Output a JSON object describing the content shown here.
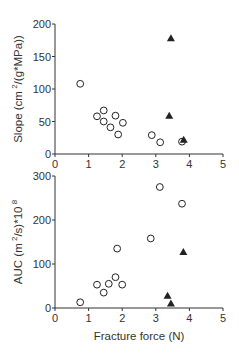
{
  "chart_data": [
    {
      "type": "scatter",
      "title": "",
      "xlabel": "",
      "ylabel": "Slope (cm^2/(g*MPa))",
      "ylabel_parts": {
        "pre": "Slope  (cm",
        "sup": "2",
        "post": "/(g*MPa))"
      },
      "xlim": [
        0,
        5
      ],
      "ylim": [
        0,
        200
      ],
      "xticks": [
        0,
        1,
        2,
        3,
        4,
        5
      ],
      "yticks": [
        0,
        50,
        100,
        150,
        200
      ],
      "grid": false,
      "legend": null,
      "series": [
        {
          "name": "open circles",
          "marker": "circle-open",
          "points": [
            [
              0.75,
              108
            ],
            [
              1.25,
              58
            ],
            [
              1.45,
              67
            ],
            [
              1.45,
              50
            ],
            [
              1.65,
              41
            ],
            [
              1.8,
              59
            ],
            [
              1.88,
              30
            ],
            [
              2.02,
              48
            ],
            [
              2.88,
              29
            ],
            [
              3.13,
              18
            ],
            [
              3.78,
              19
            ]
          ]
        },
        {
          "name": "filled triangles",
          "marker": "triangle-filled",
          "points": [
            [
              3.45,
              178
            ],
            [
              3.4,
              59
            ],
            [
              3.83,
              22
            ]
          ]
        }
      ]
    },
    {
      "type": "scatter",
      "title": "",
      "xlabel": "Fracture force (N)",
      "ylabel": "AUC (m^2/s)*10^8",
      "ylabel_parts": {
        "pre": "AUC (m",
        "sup": "2",
        "mid": "/s)*10",
        "sup2": "8"
      },
      "xlim": [
        0,
        5
      ],
      "ylim": [
        0,
        300
      ],
      "xticks": [
        0,
        1,
        2,
        3,
        4,
        5
      ],
      "yticks": [
        0,
        100,
        200,
        300
      ],
      "grid": false,
      "legend": null,
      "series": [
        {
          "name": "open circles",
          "marker": "circle-open",
          "points": [
            [
              0.75,
              13
            ],
            [
              1.25,
              53
            ],
            [
              1.45,
              35
            ],
            [
              1.6,
              55
            ],
            [
              1.8,
              70
            ],
            [
              1.85,
              135
            ],
            [
              2.0,
              53
            ],
            [
              2.85,
              158
            ],
            [
              3.12,
              275
            ],
            [
              3.78,
              237
            ]
          ]
        },
        {
          "name": "filled triangles",
          "marker": "triangle-filled",
          "points": [
            [
              3.35,
              28
            ],
            [
              3.45,
              10
            ],
            [
              3.82,
              127
            ]
          ]
        }
      ]
    }
  ],
  "layout": {
    "panels": [
      {
        "x0": 55,
        "x1": 223,
        "y0": 154,
        "y1": 24
      },
      {
        "x0": 55,
        "x1": 223,
        "y0": 308,
        "y1": 176
      }
    ],
    "colors": {
      "axis": "#333333",
      "marker": "#222222",
      "background": "#ffffff"
    }
  }
}
